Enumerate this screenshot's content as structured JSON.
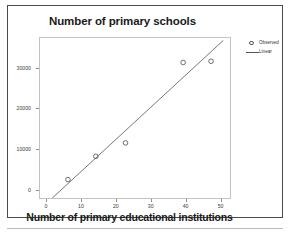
{
  "chart_data": {
    "type": "scatter",
    "title": "Number of primary schools",
    "xlabel": "Number of primary educational institutions",
    "ylabel": "",
    "xlim": [
      -2,
      53
    ],
    "ylim": [
      -2200,
      37500
    ],
    "grid": false,
    "legend_position": "right",
    "xticks": [
      0,
      10,
      20,
      30,
      40,
      50
    ],
    "xtick_labels": [
      "0",
      "10",
      "20",
      "30",
      "40",
      "50"
    ],
    "yticks": [
      0,
      10000,
      20000,
      30000
    ],
    "ytick_labels": [
      "0",
      "10000",
      "20000",
      "30000"
    ],
    "series": [
      {
        "name": "Observed",
        "marker": "circle-open",
        "color": "#555555",
        "points": [
          {
            "x": 6,
            "y": 2800
          },
          {
            "x": 14,
            "y": 8500
          },
          {
            "x": 22.5,
            "y": 11800
          },
          {
            "x": 39,
            "y": 31500
          },
          {
            "x": 47,
            "y": 31800
          }
        ]
      },
      {
        "name": "Linear",
        "type": "line",
        "color": "#666666",
        "fit_endpoints": [
          {
            "x": 1.3,
            "y": -1900
          },
          {
            "x": 50.5,
            "y": 36900
          }
        ]
      }
    ]
  },
  "legend": {
    "items": [
      {
        "label": "Observed",
        "key": "circle"
      },
      {
        "label": "Linear",
        "key": "line"
      }
    ]
  }
}
